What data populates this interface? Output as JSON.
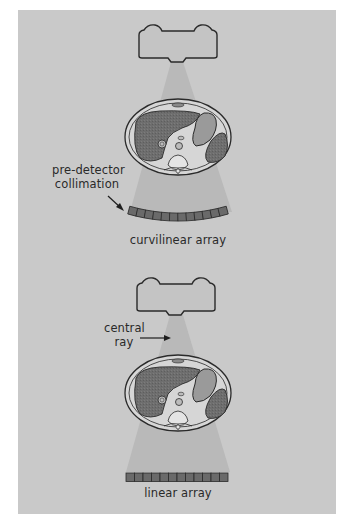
{
  "diagram": {
    "colors": {
      "panel": "#c9c9c9",
      "beam": "#b9b9b9",
      "outline": "#2a2a2a",
      "tube_fill": "#c4c4c4",
      "body_skin": "#d6d6d6",
      "organ_dark": "#6e6e6e",
      "organ_mid": "#9a9a9a",
      "detector_cell": "#6a6a6a"
    },
    "top_setup": {
      "label_callout_line1": "pre-detector",
      "label_callout_line2": "collimation",
      "array_label": "curvilinear array",
      "detector_cells": 12
    },
    "bottom_setup": {
      "label_callout_line1": "central",
      "label_callout_line2": "ray",
      "array_label": "linear array",
      "detector_cells": 12
    }
  }
}
